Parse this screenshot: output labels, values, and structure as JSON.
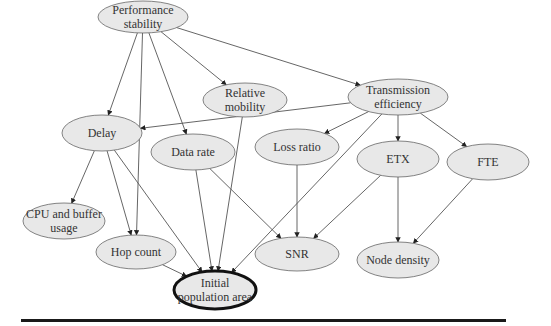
{
  "diagram": {
    "type": "directed-graph",
    "colors": {
      "node_fill": "#e8e8e8",
      "node_stroke": "#666666",
      "edge": "#555555",
      "target_stroke": "#111111"
    },
    "nodes": [
      {
        "id": "perf",
        "label_lines": [
          "Performance",
          "stability"
        ],
        "cx": 143,
        "cy": 17,
        "rx": 45,
        "ry": 16
      },
      {
        "id": "relmob",
        "label_lines": [
          "Relative",
          "mobility"
        ],
        "cx": 245,
        "cy": 100,
        "rx": 42,
        "ry": 17
      },
      {
        "id": "trans",
        "label_lines": [
          "Transmission",
          "efficiency"
        ],
        "cx": 398,
        "cy": 97,
        "rx": 50,
        "ry": 18
      },
      {
        "id": "delay",
        "label_lines": [
          "Delay"
        ],
        "cx": 102,
        "cy": 133,
        "rx": 40,
        "ry": 18
      },
      {
        "id": "datarate",
        "label_lines": [
          "Data rate"
        ],
        "cx": 193,
        "cy": 152,
        "rx": 42,
        "ry": 18
      },
      {
        "id": "loss",
        "label_lines": [
          "Loss ratio"
        ],
        "cx": 297,
        "cy": 147,
        "rx": 42,
        "ry": 18
      },
      {
        "id": "etx",
        "label_lines": [
          "ETX"
        ],
        "cx": 398,
        "cy": 159,
        "rx": 41,
        "ry": 18
      },
      {
        "id": "fte",
        "label_lines": [
          "FTE"
        ],
        "cx": 488,
        "cy": 162,
        "rx": 41,
        "ry": 18
      },
      {
        "id": "cpu",
        "label_lines": [
          "CPU and buffer",
          "usage"
        ],
        "cx": 64,
        "cy": 221,
        "rx": 41,
        "ry": 18
      },
      {
        "id": "hop",
        "label_lines": [
          "Hop count"
        ],
        "cx": 136,
        "cy": 252,
        "rx": 40,
        "ry": 17
      },
      {
        "id": "snr",
        "label_lines": [
          "SNR"
        ],
        "cx": 297,
        "cy": 254,
        "rx": 42,
        "ry": 17
      },
      {
        "id": "node",
        "label_lines": [
          "Node density"
        ],
        "cx": 398,
        "cy": 260,
        "rx": 41,
        "ry": 18
      },
      {
        "id": "init",
        "label_lines": [
          "Initial",
          "population area"
        ],
        "cx": 215,
        "cy": 290,
        "rx": 41,
        "ry": 19,
        "emphasized": true
      }
    ],
    "edges": [
      {
        "from": "perf",
        "to": "delay"
      },
      {
        "from": "perf",
        "to": "hop"
      },
      {
        "from": "perf",
        "to": "datarate"
      },
      {
        "from": "perf",
        "to": "relmob"
      },
      {
        "from": "perf",
        "to": "trans"
      },
      {
        "from": "trans",
        "to": "delay"
      },
      {
        "from": "trans",
        "to": "loss"
      },
      {
        "from": "trans",
        "to": "etx"
      },
      {
        "from": "trans",
        "to": "fte"
      },
      {
        "from": "trans",
        "to": "init"
      },
      {
        "from": "relmob",
        "to": "init"
      },
      {
        "from": "delay",
        "to": "cpu"
      },
      {
        "from": "delay",
        "to": "hop"
      },
      {
        "from": "delay",
        "to": "init"
      },
      {
        "from": "datarate",
        "to": "init"
      },
      {
        "from": "datarate",
        "to": "snr"
      },
      {
        "from": "loss",
        "to": "snr"
      },
      {
        "from": "etx",
        "to": "snr"
      },
      {
        "from": "etx",
        "to": "node"
      },
      {
        "from": "fte",
        "to": "node"
      },
      {
        "from": "hop",
        "to": "init"
      }
    ]
  }
}
